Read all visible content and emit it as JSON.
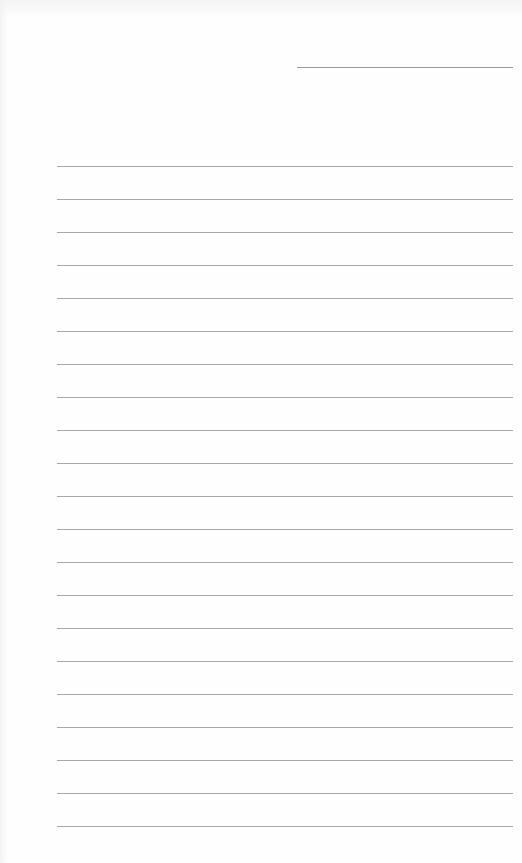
{
  "page": {
    "type": "lined-note-sheet",
    "background_color": "#fefefe",
    "line_color": "#a8a8a8",
    "date_line": {
      "x": 297,
      "y": 67,
      "width": 216
    },
    "rules": {
      "x": 57,
      "width": 456,
      "first_y": 166,
      "spacing": 33,
      "count": 21
    },
    "text_content": []
  }
}
